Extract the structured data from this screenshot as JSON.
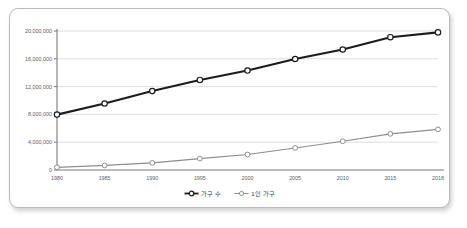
{
  "chart_data": {
    "type": "line",
    "title": "",
    "xlabel": "",
    "ylabel": "",
    "x": [
      1980,
      1985,
      1990,
      1995,
      2000,
      2005,
      2010,
      2015,
      2018
    ],
    "categories": [
      "1980",
      "1985",
      "1990",
      "1995",
      "2000",
      "2005",
      "2010",
      "2015",
      "2018"
    ],
    "ylim": [
      0,
      20000000
    ],
    "yticks": [
      0,
      4000000,
      8000000,
      12000000,
      16000000,
      20000000
    ],
    "ytick_labels": [
      "0",
      "4,000,000",
      "8,000,000",
      "12,000,000",
      "16,000,000",
      "20,000,000"
    ],
    "grid": true,
    "legend_position": "bottom-center",
    "series": [
      {
        "name": "가구 수",
        "color": "#1c1c1c",
        "marker": "circle-open",
        "values": [
          7969000,
          9571000,
          11355000,
          12958000,
          14312000,
          15971000,
          17339000,
          19111000,
          19798000
        ]
      },
      {
        "name": "1인 가구",
        "color": "#8d8d8d",
        "marker": "circle-open",
        "values": [
          383000,
          661000,
          1021000,
          1642000,
          2224000,
          3171000,
          4142000,
          5203000,
          5849000
        ]
      }
    ],
    "legend": [
      "가구 수",
      "1인 가구"
    ]
  },
  "legend": {
    "items": [
      {
        "label": "가구 수"
      },
      {
        "label": "1인 가구"
      }
    ]
  },
  "axis": {
    "y_labels": [
      "20,000,000",
      "16,000,000",
      "12,000,000",
      "8,000,000",
      "4,000,000",
      "0"
    ],
    "x_labels": [
      "1980",
      "1985",
      "1990",
      "1995",
      "2000",
      "2005",
      "2010",
      "2015",
      "2018"
    ]
  },
  "colors": {
    "series_main": "#1c1c1c",
    "series_sub": "#8d8d8d",
    "grid": "#d6d6d6",
    "axis": "#7a7a7a",
    "card_border": "#b9b9b9",
    "background": "#ffffff"
  }
}
